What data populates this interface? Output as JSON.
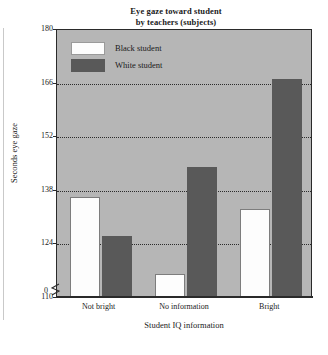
{
  "chart_data": {
    "type": "bar",
    "title": "Eye gaze toward student by teachers (subjects)",
    "title_line1": "Eye gaze toward student",
    "title_line2": "by teachers (subjects)",
    "xlabel": "Student IQ information",
    "ylabel": "Seconds eye gaze",
    "categories": [
      "Not bright",
      "No information",
      "Bright"
    ],
    "series": [
      {
        "name": "Black student",
        "values": [
          136,
          116,
          133
        ],
        "color": "#fdfdfd"
      },
      {
        "name": "White student",
        "values": [
          126,
          144,
          167
        ],
        "color": "#595959"
      }
    ],
    "ylim": [
      110,
      180
    ],
    "yticks": [
      110,
      124,
      138,
      152,
      166,
      180
    ],
    "ytick_labels": [
      "110",
      "124",
      "138",
      "152",
      "166",
      "180"
    ],
    "origin_label": "0",
    "axis_break": true,
    "grid": true,
    "gridlines_at": [
      124,
      138,
      152,
      166
    ],
    "legend_position": "top-left-inside",
    "plot_background": "#b6b6b6"
  },
  "title": {
    "line1": "Eye gaze toward student",
    "line2": "by teachers (subjects)"
  },
  "axes": {
    "y_title": "Seconds eye gaze",
    "x_title": "Student IQ information",
    "y_ticks": [
      {
        "label": "180",
        "value": 180
      },
      {
        "label": "166",
        "value": 166
      },
      {
        "label": "152",
        "value": 152
      },
      {
        "label": "138",
        "value": 138
      },
      {
        "label": "124",
        "value": 124
      },
      {
        "label": "110",
        "value": 110
      }
    ],
    "origin": "0",
    "x_ticks": [
      {
        "label": "Not bright"
      },
      {
        "label": "No information"
      },
      {
        "label": "Bright"
      }
    ]
  },
  "legend": {
    "items": [
      {
        "label": "Black student",
        "swatch": "white"
      },
      {
        "label": "White student",
        "swatch": "dark-gray"
      }
    ]
  }
}
